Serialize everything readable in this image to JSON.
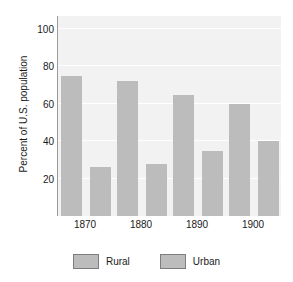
{
  "chart_data": {
    "type": "bar",
    "title": "",
    "subtitle": "",
    "xlabel": "",
    "ylabel": "Percent of U.S. population",
    "categories": [
      "1870",
      "1880",
      "1890",
      "1900"
    ],
    "series": [
      {
        "name": "Rural",
        "values": [
          75,
          72,
          65,
          60
        ],
        "color": "#bcbcbc"
      },
      {
        "name": "Urban",
        "values": [
          26,
          28,
          35,
          40
        ],
        "color": "#bcbcbc"
      }
    ],
    "ylim": [
      0,
      107
    ],
    "yticks": [
      20,
      40,
      60,
      80,
      100
    ],
    "ytick_labels": [
      "20",
      "40",
      "60",
      "80",
      "100"
    ],
    "grid": true,
    "grid_axis": "y",
    "grid_color": "#ffffff",
    "plot_background": "#f2f2f2",
    "figure_background": "#ffffff",
    "legend_position": "bottom-center",
    "legend": [
      "Rural",
      "Urban"
    ],
    "bar_color": "#bcbcbc",
    "legend_swatch_border": "#7d7d7d",
    "axis_color": "#9a9a9a",
    "text_color": "#1a1a1a"
  }
}
